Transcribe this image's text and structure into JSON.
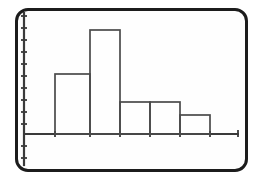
{
  "figure": {
    "kind": "histogram-plot-frame",
    "frame_style": "rounded-rectangle",
    "border_color": "#1c1c1c",
    "background_color": "#fefefe",
    "line_color": "#4a4a4a",
    "axis_color": "#3a3a3a"
  },
  "chart_data": {
    "type": "bar",
    "title": "",
    "subtitle": "",
    "xlabel": "",
    "ylabel": "",
    "categories": [
      "1",
      "2",
      "3",
      "4",
      "5"
    ],
    "values": [
      5,
      8.7,
      2.7,
      2.7,
      1.6
    ],
    "series": [
      {
        "name": "frequency",
        "values": [
          5,
          8.7,
          2.7,
          2.7,
          1.6
        ]
      }
    ],
    "bin_edges": [
      55,
      90,
      120,
      150,
      180,
      210
    ],
    "xlim": [
      0,
      10
    ],
    "ylim": [
      0,
      11
    ],
    "grid": false,
    "legend": "none",
    "tick_labels_x": [],
    "tick_labels_y": [],
    "x_tick_count": 6,
    "y_tick_count": 10,
    "annotations": []
  },
  "axes": {
    "x_axis": {
      "name": "x-axis",
      "start_px": 24,
      "end_px": 238,
      "baseline_px": 134,
      "ticks_px": [
        55,
        90,
        120,
        150,
        180,
        210
      ],
      "tick_length": 6
    },
    "y_axis": {
      "name": "y-axis",
      "x_px": 24,
      "top_px": 13,
      "bottom_px": 165,
      "ticks_px": [
        16,
        28,
        40,
        52,
        64,
        76,
        88,
        100,
        112,
        124,
        146,
        158
      ],
      "tick_length": 6
    }
  },
  "bars": [
    {
      "label": "bar-1",
      "x0_px": 55,
      "x1_px": 90,
      "top_px": 74
    },
    {
      "label": "bar-2",
      "x0_px": 90,
      "x1_px": 120,
      "top_px": 30
    },
    {
      "label": "bar-3",
      "x0_px": 120,
      "x1_px": 150,
      "top_px": 102
    },
    {
      "label": "bar-4",
      "x0_px": 150,
      "x1_px": 180,
      "top_px": 102
    },
    {
      "label": "bar-5",
      "x0_px": 180,
      "x1_px": 210,
      "top_px": 115
    }
  ]
}
